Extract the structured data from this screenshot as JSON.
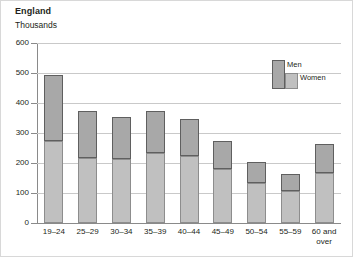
{
  "chart_data": {
    "type": "bar",
    "title": "England",
    "subtitle": "Thousands",
    "xlabel": "",
    "ylabel": "Thousands",
    "ylim": [
      0,
      600
    ],
    "ytick_step": 100,
    "yticks": [
      600,
      500,
      400,
      300,
      200,
      100,
      0
    ],
    "grid": true,
    "stacked": true,
    "legend_position": "inside-top-right",
    "categories": [
      "19–24",
      "25–29",
      "30–34",
      "35–39",
      "40–44",
      "45–49",
      "50–54",
      "55–59",
      "60 and\nover"
    ],
    "series": [
      {
        "name": "Women",
        "color": "#c0c0c0",
        "values": [
          273,
          217,
          213,
          233,
          225,
          180,
          135,
          107,
          167
        ]
      },
      {
        "name": "Men",
        "color": "#a8a8a8",
        "values": [
          222,
          156,
          140,
          142,
          123,
          93,
          70,
          56,
          98
        ]
      }
    ],
    "totals": [
      495,
      373,
      353,
      375,
      348,
      273,
      205,
      163,
      265
    ]
  },
  "legend": {
    "men_label": "Men",
    "women_label": "Women"
  },
  "colors": {
    "men": "#a8a8a8",
    "women": "#c0c0c0",
    "men_border": "#5f5f5f",
    "women_border": "#8d8d8d",
    "gridline": "#c9c9c9",
    "axis": "#8a8a8a",
    "text": "#231f20",
    "frame": "#d8d8d8"
  }
}
